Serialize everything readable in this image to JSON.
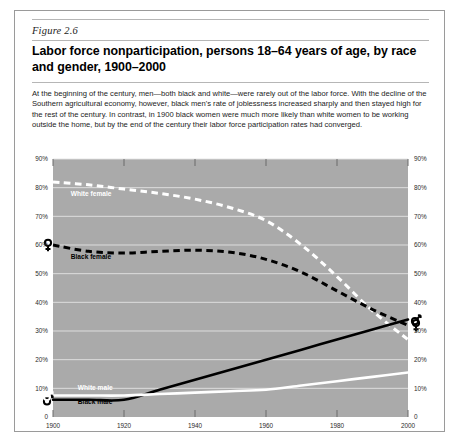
{
  "figure": {
    "number": "Figure 2.6",
    "title": "Labor force nonparticipation, persons 18–64 years of age, by race and gender, 1900–2000",
    "caption": "At the beginning of the century, men—both black and white—were rarely out of the labor force. With the decline of the Southern agricultural economy, however, black men's rate of joblessness increased sharply and then stayed high for the rest of the century. In contrast, in 1900 black women were much more likely than white women to be working outside the home, but by the end of the century their labor force participation rates had converged."
  },
  "colors": {
    "plot_background": "#aaaaaa",
    "gridline": "#e3e3e3",
    "black_series": "#000000",
    "white_series": "#ffffff",
    "card_border": "#9a9a9a",
    "rule": "#b6b6b6",
    "page_background": "#ffffff"
  },
  "chart_data": {
    "type": "line",
    "title": "Labor force nonparticipation, persons 18–64 years of age, by race and gender, 1900–2000",
    "xlabel": "",
    "ylabel": "",
    "xlim": [
      1900,
      2000
    ],
    "ylim": [
      0,
      90
    ],
    "grid": true,
    "legend_position": "inline-labels",
    "x_ticks": [
      "1900",
      "1920",
      "1940",
      "1960",
      "1980",
      "2000"
    ],
    "x_tick_values": [
      1900,
      1920,
      1940,
      1960,
      1980,
      2000
    ],
    "y_ticks": [
      "0",
      "10%",
      "20%",
      "30%",
      "40%",
      "50%",
      "60%",
      "70%",
      "80%",
      "90%"
    ],
    "y_tick_values": [
      0,
      10,
      20,
      30,
      40,
      50,
      60,
      70,
      80,
      90
    ],
    "y_axis_duplicated_right": true,
    "x": [
      1900,
      1910,
      1920,
      1930,
      1940,
      1950,
      1960,
      1970,
      1980,
      1990,
      2000
    ],
    "series": [
      {
        "name": "White female",
        "label": "White female",
        "color": "#ffffff",
        "style": "dashed",
        "marker": "female-symbol",
        "marker_at": "start-and-end",
        "start_value": 82,
        "end_value": 27,
        "values": [
          82,
          81,
          79.5,
          78,
          76,
          73,
          68.5,
          60,
          49,
          37,
          27
        ]
      },
      {
        "name": "Black female",
        "label": "Black female",
        "color": "#000000",
        "style": "dashed",
        "marker": "female-symbol",
        "marker_at": "start-and-end",
        "start_value": 60,
        "end_value": 32,
        "values": [
          60,
          57.8,
          57.2,
          57.8,
          58.2,
          57.5,
          55,
          50.5,
          44,
          37.5,
          32
        ]
      },
      {
        "name": "Black male",
        "label": "Black male",
        "color": "#000000",
        "style": "solid",
        "marker": "male-symbol",
        "marker_at": "start-and-end",
        "start_value": 6,
        "end_value": 34,
        "values": [
          6,
          6,
          6,
          9.5,
          13,
          16.5,
          20,
          23.5,
          27,
          30.5,
          34
        ]
      },
      {
        "name": "White male",
        "label": "White male",
        "color": "#ffffff",
        "style": "solid",
        "marker": "male-symbol",
        "marker_at": "start-and-end",
        "start_value": 7.5,
        "end_value": 15.5,
        "values": [
          7.5,
          7.5,
          7.5,
          8,
          8.5,
          9,
          9.5,
          11,
          12.5,
          14,
          15.5
        ]
      }
    ],
    "annotations": [
      {
        "text": "White female",
        "x": 1905,
        "y": 77
      },
      {
        "text": "Black female",
        "x": 1905,
        "y": 55
      },
      {
        "text": "White male",
        "x": 1907,
        "y": 9.5
      },
      {
        "text": "Black male",
        "x": 1907,
        "y": 4.5
      }
    ]
  }
}
